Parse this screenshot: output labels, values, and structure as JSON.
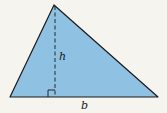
{
  "diagram": {
    "type": "triangle-area",
    "labels": {
      "height": "h",
      "base": "b"
    },
    "colors": {
      "fill": "#8fc1e3",
      "stroke": "#1a1a1a",
      "background": "#f5f4ef"
    }
  }
}
